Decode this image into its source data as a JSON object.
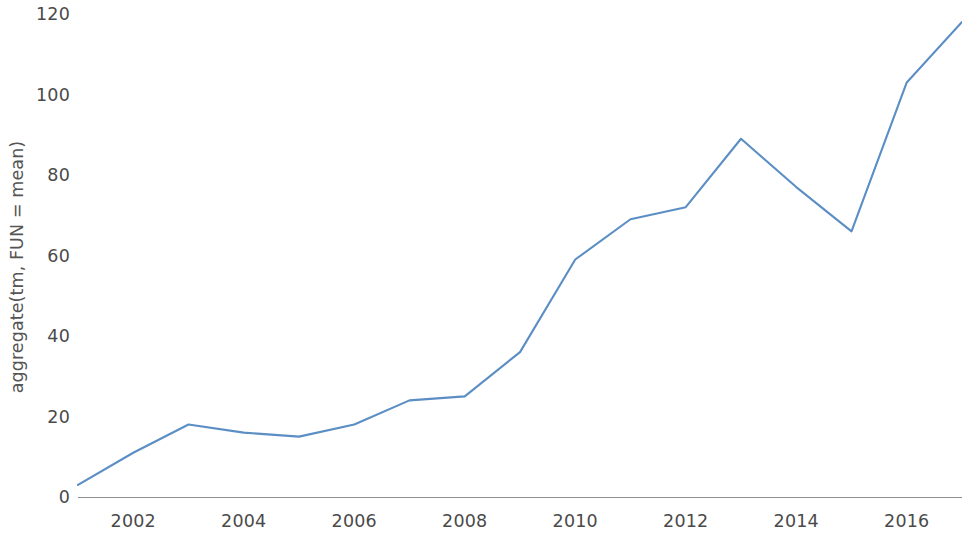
{
  "chart_data": {
    "type": "line",
    "title": "",
    "subtitle": "",
    "xlabel": "",
    "ylabel": "aggregate(tm, FUN = mean)",
    "x": [
      2001,
      2002,
      2003,
      2004,
      2005,
      2006,
      2007,
      2008,
      2009,
      2010,
      2011,
      2012,
      2013,
      2014,
      2015,
      2016,
      2017
    ],
    "values": [
      3,
      11,
      18,
      16,
      15,
      18,
      24,
      25,
      36,
      59,
      69,
      72,
      89,
      77,
      66,
      103,
      118
    ],
    "series": [
      {
        "name": "aggregate(tm, FUN = mean)",
        "color": "#5b8ec4",
        "values": [
          3,
          11,
          18,
          16,
          15,
          18,
          24,
          25,
          36,
          59,
          69,
          72,
          89,
          77,
          66,
          103,
          118
        ]
      }
    ],
    "xlim": [
      2001,
      2017
    ],
    "ylim": [
      0,
      122
    ],
    "x_tick_labels": [
      "2002",
      "2004",
      "2006",
      "2008",
      "2010",
      "2012",
      "2014",
      "2016"
    ],
    "x_tick_values": [
      2002,
      2004,
      2006,
      2008,
      2010,
      2012,
      2014,
      2016
    ],
    "y_tick_labels": [
      "0",
      "20",
      "40",
      "60",
      "80",
      "100",
      "120"
    ],
    "y_tick_values": [
      0,
      20,
      40,
      60,
      80,
      100,
      120
    ],
    "grid": false,
    "legend": false,
    "legend_position": "none",
    "line_color": "#5b8ec4",
    "axis_color": "#8e8e8e",
    "background_color": "#ffffff",
    "annotations": []
  }
}
